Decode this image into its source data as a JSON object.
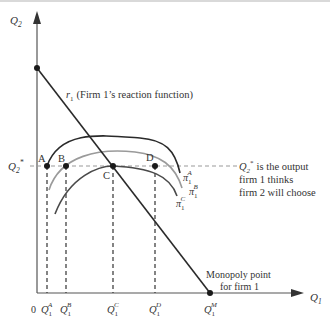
{
  "diagram": {
    "type": "isoprofit-reaction-function",
    "axes": {
      "y_label": "Q",
      "y_label_sub": "2",
      "x_label": "Q",
      "x_label_sub": "1",
      "origin_label": "0"
    },
    "reaction_function": {
      "label_symbol": "r",
      "label_sub": "1",
      "label_text": "(Firm 1’s reaction function)"
    },
    "q2_star": {
      "label": "Q",
      "label_sub": "2",
      "label_sup": "*",
      "note_line1_rest": "is the output",
      "note_line2": "firm 1 thinks",
      "note_line3": "firm 2 will choose"
    },
    "points": [
      {
        "id": "A",
        "label": "A"
      },
      {
        "id": "B",
        "label": "B"
      },
      {
        "id": "C",
        "label": "C"
      },
      {
        "id": "D",
        "label": "D"
      }
    ],
    "isoprofit_curves": [
      {
        "symbol": "π",
        "sub": "1",
        "sup": "A",
        "color": "#2a2a2a"
      },
      {
        "symbol": "π",
        "sub": "1",
        "sup": "B",
        "color": "#9a9a9a"
      },
      {
        "symbol": "π",
        "sub": "1",
        "sup": "C",
        "color": "#4a4a4a"
      }
    ],
    "x_ticks": [
      {
        "base": "Q",
        "sub": "1",
        "sup": "A"
      },
      {
        "base": "Q",
        "sub": "1",
        "sup": "B"
      },
      {
        "base": "Q",
        "sub": "1",
        "sup": "C"
      },
      {
        "base": "Q",
        "sub": "1",
        "sup": "D"
      },
      {
        "base": "Q",
        "sub": "1",
        "sup": "M"
      }
    ],
    "monopoly": {
      "line1": "Monopoly point",
      "line2": "for firm 1"
    },
    "colors": {
      "axis": "#555555",
      "reaction": "#2a2a2a",
      "dashed": "#999999"
    }
  }
}
